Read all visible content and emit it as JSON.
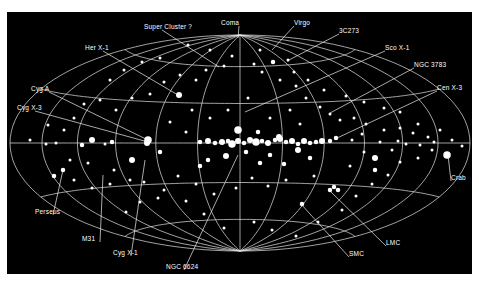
{
  "figure": {
    "type": "all-sky map (Aitoff/Hammer projection) of X-ray sources in galactic coordinates",
    "background_color": "#000000",
    "grid_color": "#e6e6e6",
    "source_color": "#ffffff",
    "projection": {
      "center_x": 240,
      "center_y": 143,
      "semi_axis_x": 230,
      "semi_axis_y": 108
    }
  },
  "labels": [
    {
      "id": "super-cluster",
      "text": "Super Cluster ?",
      "x": 144,
      "y": 24,
      "tx": 219,
      "ty": 67
    },
    {
      "id": "coma",
      "text": "Coma",
      "x": 221,
      "y": 20,
      "tx": 238,
      "ty": 38
    },
    {
      "id": "virgo",
      "text": "Virgo",
      "x": 294,
      "y": 20,
      "tx": 272,
      "ty": 50
    },
    {
      "id": "3c273",
      "text": "3C273",
      "x": 339,
      "y": 28,
      "tx": 287,
      "ty": 61
    },
    {
      "id": "sco-x1",
      "text": "Sco X-1",
      "x": 385,
      "y": 45,
      "tx": 245,
      "ty": 112
    },
    {
      "id": "ngc-3783",
      "text": "NGC 3783",
      "x": 414,
      "y": 62,
      "tx": 330,
      "ty": 113
    },
    {
      "id": "cen-x3",
      "text": "Cen X-3",
      "x": 437,
      "y": 85,
      "tx": 335,
      "ty": 139
    },
    {
      "id": "her-x1",
      "text": "Her X-1",
      "x": 85,
      "y": 45,
      "tx": 178,
      "ty": 95
    },
    {
      "id": "cyg-a",
      "text": "Cyg A",
      "x": 31,
      "y": 86,
      "tx": 148,
      "ty": 140
    },
    {
      "id": "cyg-x3",
      "text": "Cyg X-3",
      "x": 17,
      "y": 105,
      "tx": 148,
      "ty": 142
    },
    {
      "id": "crab",
      "text": "Crab",
      "x": 451,
      "y": 175,
      "tx": 448,
      "ty": 155
    },
    {
      "id": "perseus",
      "text": "Perseus",
      "x": 35,
      "y": 209,
      "tx": 63,
      "ty": 170
    },
    {
      "id": "m31",
      "text": "M31",
      "x": 82,
      "y": 236,
      "tx": 103,
      "ty": 175
    },
    {
      "id": "cyg-x1",
      "text": "Cyg X-1",
      "x": 113,
      "y": 250,
      "tx": 145,
      "ty": 160
    },
    {
      "id": "ngc-6624",
      "text": "NGC 6624",
      "x": 166,
      "y": 264,
      "tx": 238,
      "ty": 155
    },
    {
      "id": "smc",
      "text": "SMC",
      "x": 349,
      "y": 251,
      "tx": 301,
      "ty": 204
    },
    {
      "id": "lmc",
      "text": "LMC",
      "x": 386,
      "y": 240,
      "tx": 330,
      "ty": 191
    }
  ],
  "sources": [
    [
      179,
      95,
      4
    ],
    [
      148,
      140,
      5
    ],
    [
      147,
      143,
      4
    ],
    [
      200,
      142,
      3
    ],
    [
      208,
      141,
      4
    ],
    [
      215,
      143,
      3
    ],
    [
      222,
      142,
      4
    ],
    [
      228,
      141,
      3
    ],
    [
      232,
      144,
      5
    ],
    [
      238,
      141,
      4
    ],
    [
      244,
      143,
      3
    ],
    [
      250,
      140,
      4
    ],
    [
      256,
      142,
      5
    ],
    [
      262,
      141,
      3
    ],
    [
      268,
      143,
      4
    ],
    [
      275,
      140,
      3
    ],
    [
      280,
      139,
      4
    ],
    [
      286,
      142,
      3
    ],
    [
      292,
      141,
      4
    ],
    [
      298,
      144,
      3
    ],
    [
      304,
      141,
      4
    ],
    [
      310,
      143,
      3
    ],
    [
      316,
      142,
      3
    ],
    [
      322,
      141,
      4
    ],
    [
      330,
      141,
      3
    ],
    [
      336,
      138,
      3
    ],
    [
      238,
      130,
      5
    ],
    [
      258,
      132,
      3
    ],
    [
      279,
      137,
      4
    ],
    [
      298,
      150,
      4
    ],
    [
      310,
      158,
      3
    ],
    [
      270,
      155,
      3
    ],
    [
      226,
      156,
      4
    ],
    [
      208,
      160,
      3
    ],
    [
      200,
      166,
      3
    ],
    [
      246,
      152,
      3
    ],
    [
      260,
      163,
      3
    ],
    [
      284,
      164,
      3
    ],
    [
      160,
      152,
      3
    ],
    [
      132,
      160,
      4
    ],
    [
      112,
      142,
      3
    ],
    [
      92,
      140,
      4
    ],
    [
      105,
      144,
      2
    ],
    [
      82,
      145,
      3
    ],
    [
      56,
      143,
      2
    ],
    [
      46,
      144,
      2
    ],
    [
      63,
      170,
      3
    ],
    [
      54,
      176,
      3
    ],
    [
      447,
      155,
      5
    ],
    [
      375,
      158,
      4
    ],
    [
      375,
      170,
      3
    ],
    [
      330,
      190,
      3
    ],
    [
      334,
      187,
      3
    ],
    [
      338,
      190,
      3
    ],
    [
      302,
      204,
      3
    ],
    [
      273,
      62,
      3
    ],
    [
      288,
      60,
      2
    ],
    [
      260,
      50,
      2
    ],
    [
      254,
      64,
      2
    ],
    [
      262,
      72,
      2
    ],
    [
      280,
      80,
      2
    ],
    [
      296,
      86,
      2
    ],
    [
      306,
      98,
      2
    ],
    [
      320,
      107,
      2
    ],
    [
      330,
      114,
      2
    ],
    [
      340,
      120,
      2
    ],
    [
      354,
      118,
      2
    ],
    [
      366,
      124,
      2
    ],
    [
      384,
      130,
      2
    ],
    [
      400,
      128,
      2
    ],
    [
      413,
      133,
      2
    ],
    [
      428,
      137,
      2
    ],
    [
      440,
      130,
      2
    ],
    [
      432,
      150,
      2
    ],
    [
      418,
      158,
      2
    ],
    [
      400,
      162,
      2
    ],
    [
      388,
      175,
      2
    ],
    [
      372,
      184,
      2
    ],
    [
      356,
      196,
      2
    ],
    [
      342,
      210,
      2
    ],
    [
      318,
      222,
      2
    ],
    [
      296,
      236,
      2
    ],
    [
      272,
      230,
      2
    ],
    [
      254,
      222,
      2
    ],
    [
      224,
      228,
      2
    ],
    [
      204,
      214,
      2
    ],
    [
      186,
      201,
      2
    ],
    [
      164,
      190,
      2
    ],
    [
      140,
      202,
      2
    ],
    [
      126,
      212,
      2
    ],
    [
      110,
      184,
      2
    ],
    [
      92,
      188,
      2
    ],
    [
      74,
      180,
      2
    ],
    [
      70,
      160,
      2
    ],
    [
      88,
      163,
      2
    ],
    [
      114,
      170,
      2
    ],
    [
      130,
      180,
      2
    ],
    [
      144,
      182,
      2
    ],
    [
      158,
      198,
      2
    ],
    [
      178,
      176,
      2
    ],
    [
      196,
      184,
      2
    ],
    [
      214,
      194,
      2
    ],
    [
      236,
      188,
      2
    ],
    [
      252,
      178,
      2
    ],
    [
      268,
      186,
      2
    ],
    [
      286,
      180,
      2
    ],
    [
      314,
      176,
      2
    ],
    [
      350,
      166,
      2
    ],
    [
      364,
      152,
      2
    ],
    [
      392,
      150,
      2
    ],
    [
      406,
      144,
      2
    ],
    [
      418,
      124,
      2
    ],
    [
      400,
      112,
      2
    ],
    [
      384,
      108,
      2
    ],
    [
      364,
      102,
      2
    ],
    [
      346,
      96,
      2
    ],
    [
      324,
      90,
      2
    ],
    [
      308,
      80,
      2
    ],
    [
      294,
      72,
      2
    ],
    [
      224,
      66,
      2
    ],
    [
      206,
      70,
      2
    ],
    [
      196,
      80,
      2
    ],
    [
      180,
      75,
      2
    ],
    [
      164,
      82,
      2
    ],
    [
      150,
      94,
      2
    ],
    [
      132,
      98,
      2
    ],
    [
      116,
      110,
      2
    ],
    [
      100,
      100,
      2
    ],
    [
      84,
      104,
      2
    ],
    [
      74,
      118,
      2
    ],
    [
      64,
      130,
      2
    ],
    [
      48,
      125,
      2
    ],
    [
      30,
      140,
      2
    ],
    [
      110,
      80,
      2
    ],
    [
      124,
      70,
      2
    ],
    [
      142,
      62,
      2
    ],
    [
      160,
      58,
      2
    ],
    [
      188,
      45,
      2
    ],
    [
      210,
      50,
      2
    ],
    [
      232,
      56,
      2
    ],
    [
      248,
      98,
      2
    ],
    [
      228,
      110,
      2
    ],
    [
      210,
      118,
      2
    ],
    [
      192,
      110,
      2
    ],
    [
      170,
      122,
      2
    ],
    [
      186,
      132,
      2
    ],
    [
      270,
      118,
      2
    ],
    [
      290,
      110,
      2
    ],
    [
      300,
      124,
      2
    ],
    [
      352,
      140,
      2
    ],
    [
      362,
      134,
      2
    ],
    [
      380,
      142,
      2
    ],
    [
      398,
      141,
      2
    ],
    [
      420,
      145,
      2
    ],
    [
      434,
      142,
      2
    ],
    [
      452,
      140,
      2
    ],
    [
      462,
      146,
      2
    ]
  ]
}
